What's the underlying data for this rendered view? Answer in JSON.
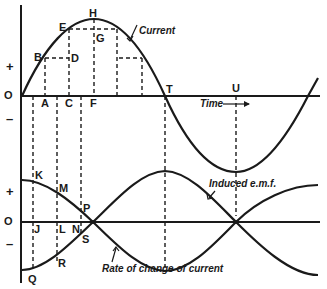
{
  "diagram": {
    "upper": {
      "origin_label": "O",
      "plus": "+",
      "minus": "–",
      "curve_label": "Current",
      "axis_label": "Time",
      "points": {
        "A": "A",
        "B": "B",
        "C": "C",
        "D": "D",
        "E": "E",
        "F": "F",
        "G": "G",
        "H": "H",
        "T": "T",
        "U": "U"
      }
    },
    "lower": {
      "origin_label": "O",
      "plus": "+",
      "minus": "–",
      "emf_label": "Induced e.m.f.",
      "rate_label": "Rate of change of current",
      "points": {
        "K": "K",
        "M": "M",
        "P": "P",
        "J": "J",
        "L": "L",
        "N": "N",
        "S": "S",
        "R": "R",
        "Q": "Q"
      }
    },
    "colors": {
      "ink": "#1a1a1a",
      "background": "#ffffff"
    }
  }
}
